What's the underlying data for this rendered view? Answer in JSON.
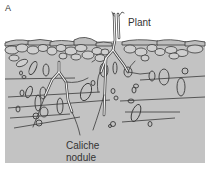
{
  "figure": {
    "panel_label": "A",
    "labels": {
      "plant": "Plant",
      "caliche_line1": "Caliche",
      "caliche_line2": "nodule"
    },
    "colors": {
      "soil": "#c3c3c3",
      "outline": "#3a3a3a",
      "pebble_fill": "#cfcfcf",
      "root": "#f4f4f4",
      "background": "#ffffff"
    }
  }
}
